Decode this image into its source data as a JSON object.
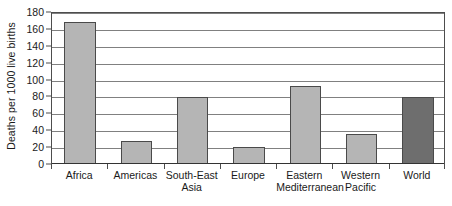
{
  "chart_data": {
    "type": "bar",
    "title": "",
    "xlabel": "",
    "ylabel": "Deaths per 1000 live births",
    "categories": [
      "Africa",
      "South-East Asia",
      "Americas",
      "Europe",
      "Eastern Mediterranean",
      "Western Pacific",
      "World"
    ],
    "category_labels": [
      "Africa",
      "Americas",
      "South-East\nAsia",
      "Europe",
      "Eastern\nMediterranean",
      "Western\nPacific",
      "World"
    ],
    "values": [
      168,
      27,
      79,
      20,
      92,
      35,
      79
    ],
    "ylim": [
      0,
      180
    ],
    "ytick_step": 20,
    "yticks": [
      0,
      20,
      40,
      60,
      80,
      100,
      120,
      140,
      160,
      180
    ],
    "ytick_labels": [
      "0",
      "20",
      "40",
      "60",
      "80",
      "100",
      "120",
      "140",
      "160",
      "180"
    ],
    "grid": true,
    "legend": false,
    "bar_colors": [
      "#b5b5b5",
      "#b5b5b5",
      "#b5b5b5",
      "#b5b5b5",
      "#b5b5b5",
      "#b5b5b5",
      "#6e6e6e"
    ],
    "bar_edge_color": "#4a4a4a",
    "gridline_color": "#808080",
    "axis_color": "#4d4d4d",
    "background": "#ffffff",
    "points": [
      {
        "category": "Africa",
        "label": "Africa",
        "value": 168,
        "color": "#b5b5b5"
      },
      {
        "category": "Americas",
        "label": "Americas",
        "value": 27,
        "color": "#b5b5b5"
      },
      {
        "category": "South-East Asia",
        "label": "South-East Asia",
        "value": 79,
        "color": "#b5b5b5"
      },
      {
        "category": "Europe",
        "label": "Europe",
        "value": 20,
        "color": "#b5b5b5"
      },
      {
        "category": "Eastern Mediterranean",
        "label": "Eastern Mediterranean",
        "value": 92,
        "color": "#b5b5b5"
      },
      {
        "category": "Western Pacific",
        "label": "Western Pacific",
        "value": 35,
        "color": "#b5b5b5"
      },
      {
        "category": "World",
        "label": "World",
        "value": 79,
        "color": "#6e6e6e"
      }
    ]
  }
}
